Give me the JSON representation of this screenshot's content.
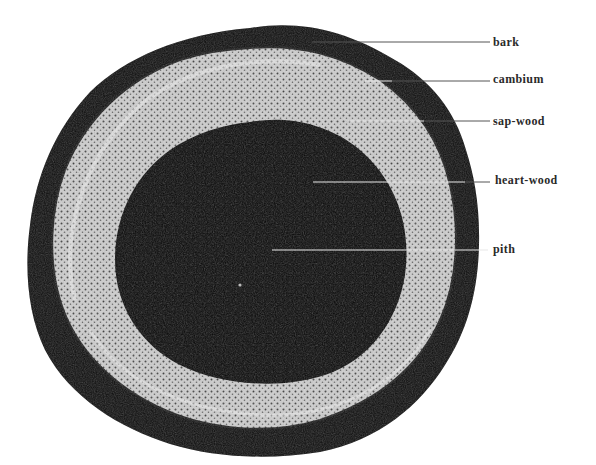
{
  "figure": {
    "colors": {
      "background": "#ffffff",
      "bark": "#0c0c0c",
      "sapwood_light": "#d8d8d8",
      "sapwood_dark": "#3a3a3a",
      "heartwood": "#0a0a0a",
      "label_text": "#2a2a2a",
      "leader_line_dark": "#555555",
      "leader_line_light": "#e8e8e8"
    },
    "labels": [
      {
        "id": "bark",
        "text": "bark",
        "x": 493,
        "y": 36,
        "line_from_x": 312,
        "line_y": 42
      },
      {
        "id": "cambium",
        "text": "cambium",
        "x": 493,
        "y": 73,
        "line_from_x": 365,
        "line_y": 81
      },
      {
        "id": "sap-wood",
        "text": "sap-wood",
        "x": 493,
        "y": 115,
        "line_from_x": 420,
        "line_y": 121
      },
      {
        "id": "heart-wood",
        "text": "heart-wood",
        "x": 495,
        "y": 174,
        "line_from_x": 313,
        "line_y": 182
      },
      {
        "id": "pith",
        "text": "pith",
        "x": 493,
        "y": 243,
        "line_from_x": 272,
        "line_y": 250
      }
    ]
  }
}
